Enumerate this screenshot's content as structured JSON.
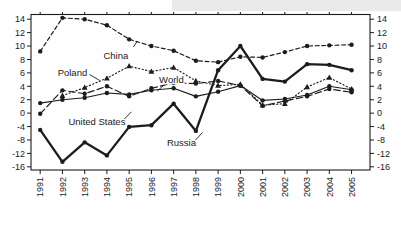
{
  "chart_data": {
    "type": "line",
    "title": "",
    "xlabel": "",
    "ylabel": "",
    "grid": false,
    "legend_position": "inline-annotations",
    "x": [
      1991,
      1992,
      1993,
      1994,
      1995,
      1996,
      1997,
      1998,
      1999,
      2000,
      2001,
      2002,
      2003,
      2004,
      2005
    ],
    "x_tick_labels": [
      "1991",
      "1992",
      "1993",
      "1994",
      "1995",
      "1996",
      "1997",
      "1998",
      "1999",
      "2000",
      "2001",
      "2002",
      "2003",
      "2004",
      "2005"
    ],
    "y_ticks": [
      14,
      12,
      10,
      8,
      6,
      4,
      2,
      0,
      -4,
      -8,
      -12,
      -16
    ],
    "y_tick_labels": [
      "14",
      "12",
      "10",
      "8",
      "6",
      "4",
      "2",
      "0",
      "-4",
      "-8",
      "-12",
      "-16"
    ],
    "y_axis_note": "nonlinear scale: each tick = 2 units above zero, 4 units below zero; labels shown on both left and right sides",
    "series": [
      {
        "name": "China",
        "marker": "circle",
        "line_style": "dashed",
        "values": [
          9.2,
          14.2,
          14.0,
          13.1,
          11.0,
          10.0,
          9.3,
          7.8,
          7.6,
          8.4,
          8.3,
          9.1,
          10.0,
          10.1,
          10.2
        ]
      },
      {
        "name": "Poland",
        "marker": "triangle",
        "line_style": "dotted",
        "values": [
          null,
          2.6,
          3.8,
          5.2,
          7.0,
          6.2,
          6.8,
          4.8,
          4.1,
          4.3,
          1.2,
          1.4,
          3.9,
          5.3,
          3.6
        ]
      },
      {
        "name": "World",
        "marker": "circle",
        "line_style": "solid-thin",
        "values": [
          1.5,
          2.0,
          2.3,
          3.0,
          2.8,
          3.4,
          3.7,
          2.5,
          3.2,
          4.1,
          1.9,
          2.1,
          2.7,
          4.0,
          3.5
        ]
      },
      {
        "name": "United States",
        "marker": "circle",
        "line_style": "long-dash",
        "values": [
          -0.2,
          3.4,
          2.9,
          4.0,
          2.5,
          3.7,
          4.5,
          4.4,
          4.8,
          4.1,
          1.1,
          1.8,
          2.5,
          3.6,
          3.1
        ]
      },
      {
        "name": "Russia",
        "marker": "circle",
        "line_style": "solid-thick",
        "values": [
          -5.0,
          -14.5,
          -8.7,
          -12.6,
          -4.1,
          -3.6,
          1.4,
          -5.3,
          6.4,
          10.0,
          5.1,
          4.7,
          7.3,
          7.2,
          6.4
        ]
      }
    ],
    "annotations": [
      {
        "text": "China",
        "year": 1994.4,
        "value": 8.5,
        "leader": [
          [
            1995.19,
            9.85
          ],
          [
            1995.37,
            10.75
          ]
        ]
      },
      {
        "text": "Poland",
        "year": 1992.45,
        "value": 6.1,
        "leader": [
          [
            1993.22,
            5.76
          ],
          [
            1993.67,
            4.87
          ]
        ]
      },
      {
        "text": "World",
        "year": 1996.9,
        "value": 4.95,
        "leader": [
          [
            1996.54,
            4.12
          ],
          [
            1996.27,
            3.3
          ]
        ]
      },
      {
        "text": "United States",
        "year": 1993.55,
        "value": -2.45,
        "leader": [
          [
            1994.72,
            -2.19
          ],
          [
            1995.1,
            0.19
          ]
        ]
      },
      {
        "text": "Russia",
        "year": 1997.35,
        "value": -8.9,
        "leader": [
          [
            1997.96,
            -8.16
          ],
          [
            1998.3,
            -5.77
          ]
        ]
      }
    ],
    "colors": {
      "ink": "#1c1c1c",
      "background": "#ffffff",
      "scan_shadow": "#d9d9d9"
    }
  }
}
